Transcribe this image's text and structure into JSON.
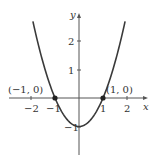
{
  "chart_data": {
    "type": "line",
    "title": "",
    "function": "y = x^2 - 1",
    "xlabel": "x",
    "ylabel": "y",
    "xlim": [
      -2.6,
      2.9
    ],
    "ylim": [
      -2,
      3
    ],
    "grid": false,
    "x_ticks": [
      -2,
      -1,
      1,
      2
    ],
    "x_tick_labels": [
      "−2",
      "−1",
      "1",
      "2"
    ],
    "y_ticks": [
      -1,
      1,
      2
    ],
    "y_tick_labels": [
      "−1",
      "1",
      "2"
    ],
    "series": [
      {
        "name": "parabola",
        "x": [
          -2,
          -1.5,
          -1,
          -0.5,
          0,
          0.5,
          1,
          1.5,
          2
        ],
        "y": [
          3,
          1.25,
          0,
          -0.75,
          -1,
          -0.75,
          0,
          1.25,
          3
        ]
      }
    ],
    "points": [
      {
        "x": -1,
        "y": 0,
        "label": "(−1, 0)"
      },
      {
        "x": 1,
        "y": 0,
        "label": "(1, 0)"
      }
    ],
    "colors": {
      "curve": "#3a3a3a",
      "axis": "#555555",
      "point": "#222222"
    }
  }
}
